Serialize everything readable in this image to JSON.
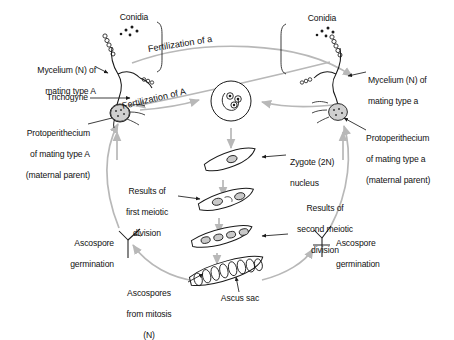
{
  "diagram": {
    "background": "#ffffff",
    "ink_color": "#1a1a1a",
    "arrow_color": "#b8b8b8"
  },
  "labels": {
    "conidia_left": "Conidia",
    "conidia_right": "Conidia",
    "mycelium_left_line1": "Mycelium (N) of",
    "mycelium_left_line2": "mating type A",
    "mycelium_right_line1": "Mycelium (N) of",
    "mycelium_right_line2": "mating type a",
    "trichogyne": "Trichogyne",
    "protoperithecium_left_line1": "Protoperithecium",
    "protoperithecium_left_line2": "of mating type A",
    "protoperithecium_left_line3": "(maternal parent)",
    "protoperithecium_right_line1": "Protoperithecium",
    "protoperithecium_right_line2": "of mating type a",
    "protoperithecium_right_line3": "(maternal parent)",
    "fertilization_of_a": "Fertilization of a",
    "fertilization_of_A": "Fertilization of A",
    "zygote_line1": "Zygote (2N)",
    "zygote_line2": "nucleus",
    "first_meiotic_line1": "Results of",
    "first_meiotic_line2": "first meiotic",
    "first_meiotic_line3": "division",
    "second_meiotic_line1": "Results of",
    "second_meiotic_line2": "second meiotic",
    "second_meiotic_line3": "division",
    "ascospore_germination_left_line1": "Ascospore",
    "ascospore_germination_left_line2": "germination",
    "ascospore_germination_right_line1": "Ascospore",
    "ascospore_germination_right_line2": "germination",
    "ascospores_mitosis_line1": "Ascospores",
    "ascospores_mitosis_line2": "from mitosis",
    "ascospores_mitosis_line3": "(N)",
    "ascus_sac": "Ascus sac"
  },
  "stages": {
    "zygote_nuclei_count": 1,
    "first_meiosis_nuclei_count": 2,
    "second_meiosis_nuclei_count": 4,
    "ascus_ascospores_count": 8,
    "conidia_dots_left": 5,
    "conidia_dots_right": 5
  }
}
